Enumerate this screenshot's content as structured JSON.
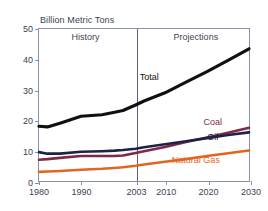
{
  "chart_data": {
    "type": "line",
    "title": "Billion Metric Tons",
    "xlabel": "",
    "ylabel": "",
    "xlim": [
      1980,
      2030
    ],
    "ylim": [
      0,
      50
    ],
    "yticks": [
      0,
      10,
      20,
      30,
      40,
      50
    ],
    "xticks": [
      1980,
      1990,
      2003,
      2010,
      2020,
      2030
    ],
    "grid": false,
    "legend": "inline-labels",
    "annotations": [
      {
        "text": "History",
        "x": 1991,
        "y": 47
      },
      {
        "text": "Projections",
        "x": 2017,
        "y": 47
      }
    ],
    "divider_x": 2003,
    "x": [
      1980,
      1982,
      1985,
      1990,
      1995,
      1998,
      2000,
      2003,
      2005,
      2010,
      2015,
      2020,
      2025,
      2030
    ],
    "series": [
      {
        "name": "Total",
        "color": "#101010",
        "label_x": 2006,
        "label_y": 34,
        "values": [
          18.0,
          17.8,
          19.0,
          21.3,
          21.8,
          22.6,
          23.2,
          25.0,
          26.3,
          29.0,
          32.5,
          36.0,
          39.7,
          43.5
        ]
      },
      {
        "name": "Coal",
        "color": "#7d2a47",
        "label_x": 2021,
        "label_y": 19.5,
        "values": [
          7.0,
          7.2,
          7.6,
          8.2,
          8.2,
          8.2,
          8.4,
          9.2,
          9.8,
          11.2,
          12.8,
          14.3,
          15.9,
          17.5
        ]
      },
      {
        "name": "Oil",
        "color": "#1e2148",
        "label_x": 2021,
        "label_y": 14.5,
        "values": [
          9.5,
          9.0,
          9.0,
          9.6,
          9.8,
          10.0,
          10.2,
          10.6,
          11.1,
          12.1,
          13.1,
          14.1,
          15.1,
          16.0
        ]
      },
      {
        "name": "Natural Gas",
        "color": "#e2661f",
        "label_x": 2017,
        "label_y": 7.2,
        "values": [
          3.0,
          3.1,
          3.3,
          3.7,
          4.0,
          4.3,
          4.5,
          5.0,
          5.4,
          6.3,
          7.2,
          8.2,
          9.1,
          10.0
        ]
      }
    ]
  }
}
